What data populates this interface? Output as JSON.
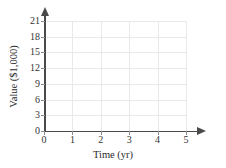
{
  "chart_data": {
    "type": "line",
    "title": "",
    "subtitle": "",
    "xlabel": "Time (yr)",
    "ylabel": "Value ($1,000)",
    "xlim": [
      0,
      5
    ],
    "ylim": [
      0,
      21
    ],
    "xticks": [
      0,
      1,
      2,
      3,
      4,
      5
    ],
    "yticks": [
      0,
      3,
      6,
      9,
      12,
      15,
      18,
      21
    ],
    "xtick_labels": [
      "0",
      "1",
      "2",
      "3",
      "4",
      "5"
    ],
    "ytick_labels": [
      "0",
      "3",
      "6",
      "9",
      "12",
      "15",
      "18",
      "21"
    ],
    "grid": true,
    "legend": false,
    "legend_position": "none",
    "series": [],
    "values": [],
    "annotations": [],
    "note": "Empty coordinate grid template with no plotted data"
  },
  "axes": {
    "x_title": "Time (yr)",
    "y_title": "Value ($1,000)"
  },
  "style": {
    "background": "#ffffff",
    "grid_color": "#e9e9e9",
    "axis_color": "#4a4a4a",
    "tick_text_color": "#333333",
    "title_color": "#2b2b2b"
  }
}
